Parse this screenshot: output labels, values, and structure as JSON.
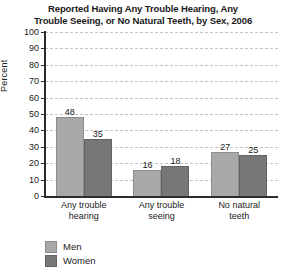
{
  "chart_data": {
    "type": "bar",
    "title": "Reported Having Any Trouble Hearing, Any Trouble Seeing, or No Natural Teeth, by Sex, 2006",
    "title_lines": [
      "Reported Having Any Trouble Hearing, Any",
      "Trouble Seeing, or No Natural Teeth, by Sex, 2006"
    ],
    "xlabel": "",
    "ylabel": "Percent",
    "ylim": [
      0,
      100
    ],
    "ytick_step": 10,
    "yticks": [
      0,
      10,
      20,
      30,
      40,
      50,
      60,
      70,
      80,
      90,
      100
    ],
    "ytick_labels": [
      "0",
      "10",
      "20",
      "30",
      "40",
      "50",
      "60",
      "70",
      "80",
      "90",
      "100"
    ],
    "grid": "horizontal-dashed",
    "legend_position": "bottom-left",
    "categories": [
      "Any trouble hearing",
      "Any trouble seeing",
      "No natural teeth"
    ],
    "category_lines": [
      [
        "Any trouble",
        "hearing"
      ],
      [
        "Any trouble",
        "seeing"
      ],
      [
        "No natural",
        "teeth"
      ]
    ],
    "series": [
      {
        "name": "Men",
        "color": "#a9a9a9",
        "values": [
          48,
          16,
          27
        ]
      },
      {
        "name": "Women",
        "color": "#777777",
        "values": [
          35,
          18,
          25
        ]
      }
    ],
    "data_labels": [
      [
        "48",
        "35"
      ],
      [
        "16",
        "18"
      ],
      [
        "27",
        "25"
      ]
    ]
  },
  "legend": {
    "items": [
      {
        "label": "Men",
        "color": "#a9a9a9"
      },
      {
        "label": "Women",
        "color": "#777777"
      }
    ]
  },
  "colors": {
    "men": "#a9a9a9",
    "women": "#777777",
    "axis": "#2b2b2b",
    "grid": "#c3c3c3",
    "background": "#ffffff",
    "text": "#1a1a1a"
  }
}
